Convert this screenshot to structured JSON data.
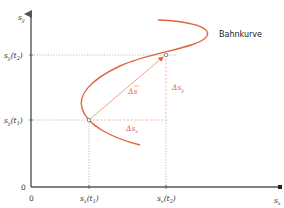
{
  "diagram": {
    "title": "Bahnkurve",
    "colors": {
      "curve": "#e0663a",
      "delta": "#e0663a",
      "axis": "#555555",
      "guide": "#aaaaaa"
    },
    "axes": {
      "y_label": "s",
      "y_label_sub": "y",
      "x_label": "s",
      "x_label_sub": "x",
      "origin_y": "0",
      "origin_x": "0"
    },
    "ticks": {
      "y_t1": {
        "base": "s",
        "sub": "y",
        "arg": "(t",
        "arg_sub": "1",
        "close": ")"
      },
      "y_t2": {
        "base": "s",
        "sub": "y",
        "arg": "(t",
        "arg_sub": "2",
        "close": ")"
      },
      "x_t1": {
        "base": "s",
        "sub": "x",
        "arg": "(t",
        "arg_sub": "1",
        "close": ")"
      },
      "x_t2": {
        "base": "s",
        "sub": "x",
        "arg": "(t",
        "arg_sub": "2",
        "close": ")"
      }
    },
    "annotations": {
      "delta_s_vec": "Δs",
      "delta_sy": "Δs",
      "delta_sy_sub": "y",
      "delta_sx": "Δs",
      "delta_sx_sub": "x"
    }
  }
}
